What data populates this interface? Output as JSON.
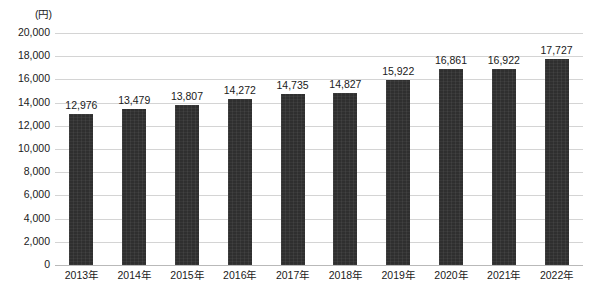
{
  "chart_data": {
    "type": "bar",
    "title": "",
    "subtitle": "",
    "xlabel": "",
    "ylabel": "",
    "unit_label": "(円)",
    "categories": [
      "2013年",
      "2014年",
      "2015年",
      "2016年",
      "2017年",
      "2018年",
      "2019年",
      "2020年",
      "2021年",
      "2022年"
    ],
    "values": [
      12976,
      13479,
      13807,
      14272,
      14735,
      14827,
      15922,
      16861,
      16922,
      17727
    ],
    "value_labels": [
      "12,976",
      "13,479",
      "13,807",
      "14,272",
      "14,735",
      "14,827",
      "15,922",
      "16,861",
      "16,922",
      "17,727"
    ],
    "ylim": [
      0,
      20000
    ],
    "ytick_values": [
      20000,
      18000,
      16000,
      14000,
      12000,
      10000,
      8000,
      6000,
      4000,
      2000,
      0
    ],
    "ytick_labels": [
      "20,000",
      "18,000",
      "16,000",
      "14,000",
      "12,000",
      "10,000",
      "8,000",
      "6,000",
      "4,000",
      "2,000",
      "0"
    ],
    "grid": true,
    "legend": "none",
    "bar_color": "#2f2f2f",
    "grid_color": "#d4d4d4",
    "axis_color": "#b9b9b9",
    "background_color": "#ffffff"
  },
  "caption": {
    "text": ""
  }
}
